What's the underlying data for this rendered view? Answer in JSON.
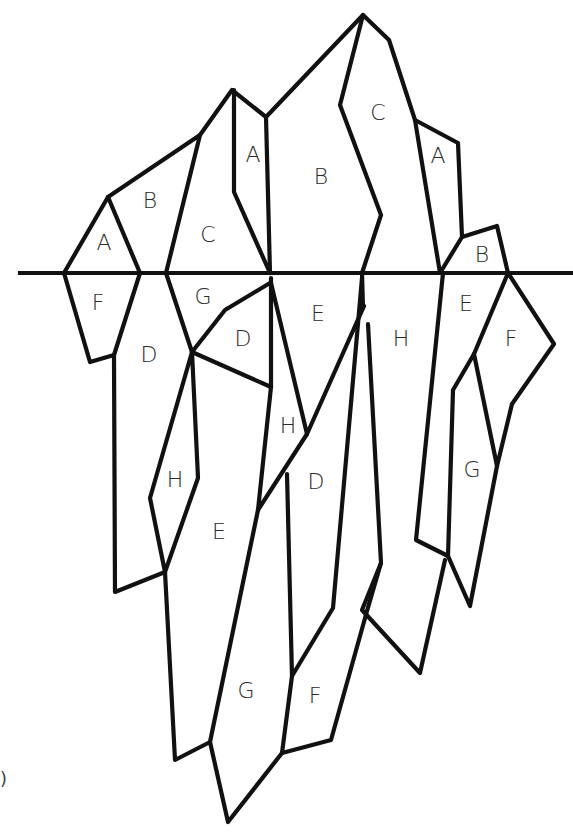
{
  "diagram": {
    "colors": {
      "stroke": "#111111",
      "label": "#2a2a2a",
      "background": "#ffffff"
    },
    "waterline": {
      "x1": 18,
      "x2": 573,
      "y": 273
    },
    "regions": [
      {
        "id": "above-A-left",
        "label": "A",
        "x": 104,
        "y": 244
      },
      {
        "id": "above-B-left",
        "label": "B",
        "x": 150,
        "y": 202
      },
      {
        "id": "above-C-left",
        "label": "C",
        "x": 208,
        "y": 236
      },
      {
        "id": "above-A-strip",
        "label": "A",
        "x": 253,
        "y": 156
      },
      {
        "id": "above-B-center",
        "label": "B",
        "x": 321,
        "y": 178
      },
      {
        "id": "above-C-peak",
        "label": "C",
        "x": 378,
        "y": 114
      },
      {
        "id": "above-A-right",
        "label": "A",
        "x": 438,
        "y": 157
      },
      {
        "id": "above-B-right",
        "label": "B",
        "x": 482,
        "y": 256
      },
      {
        "id": "below-F-left",
        "label": "F",
        "x": 98,
        "y": 304
      },
      {
        "id": "below-G-left",
        "label": "G",
        "x": 203,
        "y": 298
      },
      {
        "id": "below-D-left",
        "label": "D",
        "x": 149,
        "y": 356
      },
      {
        "id": "below-D-inner",
        "label": "D",
        "x": 243,
        "y": 340
      },
      {
        "id": "below-E-center",
        "label": "E",
        "x": 318,
        "y": 315
      },
      {
        "id": "below-H-center",
        "label": "H",
        "x": 401,
        "y": 340
      },
      {
        "id": "below-E-right",
        "label": "E",
        "x": 466,
        "y": 305
      },
      {
        "id": "below-F-right",
        "label": "F",
        "x": 511,
        "y": 340
      },
      {
        "id": "below-H-middle",
        "label": "H",
        "x": 288,
        "y": 427
      },
      {
        "id": "below-H-left",
        "label": "H",
        "x": 175,
        "y": 481
      },
      {
        "id": "below-D-lower",
        "label": "D",
        "x": 316,
        "y": 483
      },
      {
        "id": "below-G-right",
        "label": "G",
        "x": 472,
        "y": 471
      },
      {
        "id": "below-E-lower",
        "label": "E",
        "x": 219,
        "y": 533
      },
      {
        "id": "below-G-bottom",
        "label": "G",
        "x": 246,
        "y": 692
      },
      {
        "id": "below-F-bottom",
        "label": "F",
        "x": 315,
        "y": 697
      }
    ],
    "corner_mark": ")"
  }
}
